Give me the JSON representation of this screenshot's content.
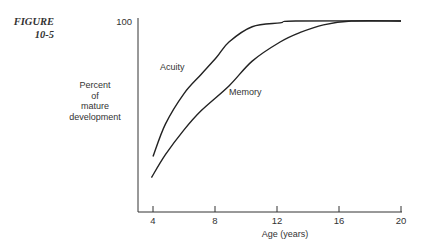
{
  "figure": {
    "label_line1": "FIGURE",
    "label_line2": "10-5"
  },
  "axes": {
    "ylabel_lines": [
      "Percent",
      "of",
      "mature",
      "development"
    ],
    "xlabel": "Age (years)",
    "y_tick_label": "100",
    "x_tick_labels": [
      "4",
      "8",
      "12",
      "16",
      "20"
    ]
  },
  "series_labels": {
    "acuity": "Acuity",
    "memory": "Memory"
  },
  "chart_data": {
    "type": "line",
    "title": "",
    "xlabel": "Age (years)",
    "ylabel": "Percent of mature development",
    "xlim": [
      3,
      20
    ],
    "ylim": [
      0,
      100
    ],
    "x_ticks": [
      4,
      8,
      12,
      16,
      20
    ],
    "y_ticks": [
      100
    ],
    "grid": false,
    "legend": "inline labels on curves",
    "series": [
      {
        "name": "Acuity",
        "x": [
          4,
          4.8,
          6,
          7.1,
          8.1,
          8.9,
          10.4,
          12.2,
          13.2,
          20
        ],
        "y": [
          29,
          46,
          62,
          72,
          81,
          89,
          97,
          99,
          100,
          100
        ]
      },
      {
        "name": "Memory",
        "x": [
          3.9,
          4.8,
          6,
          7.1,
          8.9,
          10.4,
          12.2,
          13.5,
          15,
          16.8,
          20
        ],
        "y": [
          18,
          30,
          43,
          53,
          66,
          79,
          89,
          94,
          98,
          100,
          100
        ]
      }
    ]
  }
}
